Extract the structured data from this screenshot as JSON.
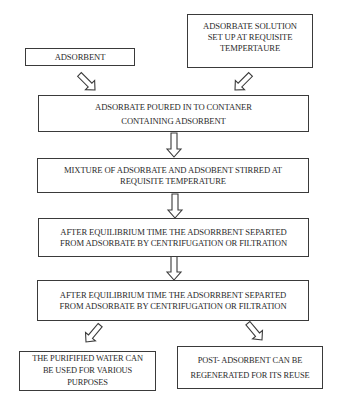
{
  "diagram": {
    "type": "flowchart",
    "title": "",
    "nodes": [
      {
        "id": "adsorbent",
        "lines": [
          "ADSORBENT"
        ]
      },
      {
        "id": "solution",
        "lines": [
          "ADSORBATE SOLUTION",
          "SET UP AT REQUISITE",
          "TEMPERTAURE"
        ]
      },
      {
        "id": "poured",
        "lines": [
          "ADSORBATE POURED IN TO CONTANER",
          "CONTAINING ADSORBENT"
        ]
      },
      {
        "id": "stirred",
        "lines": [
          "MIXTURE OF ADSORBATE AND ADSOBENT STIRRED AT",
          "REQUISITE TEMPERATURE"
        ]
      },
      {
        "id": "separated1",
        "lines": [
          "AFTER EQUILIBRIUM TIME THE ADSORRBENT SEPARTED",
          "FROM ADSORBATE BY CENTRIFUGATION OR FILTRATION"
        ]
      },
      {
        "id": "separated2",
        "lines": [
          "AFTER EQUILIBRIUM TIME THE ADSORRBENT SEPARTED",
          "FROM ADSORBATE BY CENTRIFUGATION OR FILTRATION"
        ]
      },
      {
        "id": "water",
        "lines": [
          "THE PURIFIFIED WATER CAN",
          "BE USED FOR VARIOUS",
          "PURPOSES"
        ]
      },
      {
        "id": "regenerate",
        "lines": [
          "POST- ADSORBENT CAN BE",
          "REGENERATED FOR ITS REUSE"
        ]
      }
    ],
    "edges": [
      {
        "from": "adsorbent",
        "to": "poured"
      },
      {
        "from": "solution",
        "to": "poured"
      },
      {
        "from": "poured",
        "to": "stirred"
      },
      {
        "from": "stirred",
        "to": "separated1"
      },
      {
        "from": "separated1",
        "to": "separated2"
      },
      {
        "from": "separated2",
        "to": "water"
      },
      {
        "from": "separated2",
        "to": "regenerate"
      }
    ],
    "colors": {
      "stroke": "#3a3a3a",
      "text": "#2a2a2a",
      "background": "#ffffff"
    }
  }
}
